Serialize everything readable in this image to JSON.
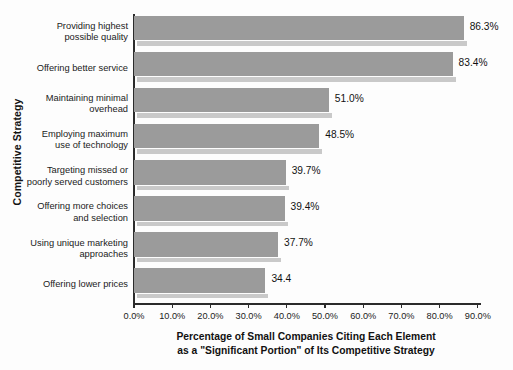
{
  "chart_data": {
    "type": "bar",
    "orientation": "horizontal",
    "title": "",
    "xlabel": "Percentage of Small Companies Citing Each Element as a \"Significant Portion\" of Its Competitive Strategy",
    "ylabel": "Competitive Strategy",
    "categories": [
      "Providing highest possible quality",
      "Offering better service",
      "Maintaining minimal overhead",
      "Employing maximum use of technology",
      "Targeting missed or poorly served customers",
      "Offering more choices and selection",
      "Using unique marketing approaches",
      "Offering lower prices"
    ],
    "values": [
      86.3,
      83.4,
      51.0,
      48.5,
      39.7,
      39.4,
      37.7,
      34.4
    ],
    "data_labels": [
      "86.3%",
      "83.4%",
      "51.0%",
      "48.5%",
      "39.7%",
      "39.4%",
      "37.7%",
      "34.4"
    ],
    "xlim": [
      0,
      90
    ],
    "xticks": [
      0,
      10,
      20,
      30,
      40,
      50,
      60,
      70,
      80,
      90
    ],
    "xticklabels": [
      "0.0%",
      "10.0%",
      "20.0%",
      "30.0%",
      "40.0%",
      "50.0%",
      "60.0%",
      "70.0%",
      "80.0%",
      "90.0%"
    ],
    "grid": false,
    "legend": false,
    "bar_color": "#9b9b9b",
    "bar_shadow_color": "#c9c9c9",
    "axis_color": "#2b2b2b",
    "background": "#fdfdfd"
  },
  "axis": {
    "ylabel_text": "Competitive Strategy",
    "xtitle_line1": "Percentage of Small Companies Citing Each Element",
    "xtitle_line2": "as a \"Significant Portion\" of Its Competitive Strategy"
  },
  "categories_lines": [
    [
      "Providing highest",
      "possible quality"
    ],
    [
      "Offering better service"
    ],
    [
      "Maintaining minimal",
      "overhead"
    ],
    [
      "Employing maximum",
      "use of technology"
    ],
    [
      "Targeting missed or",
      "poorly served customers"
    ],
    [
      "Offering more choices",
      "and selection"
    ],
    [
      "Using unique marketing",
      "approaches"
    ],
    [
      "Offering lower prices"
    ]
  ]
}
